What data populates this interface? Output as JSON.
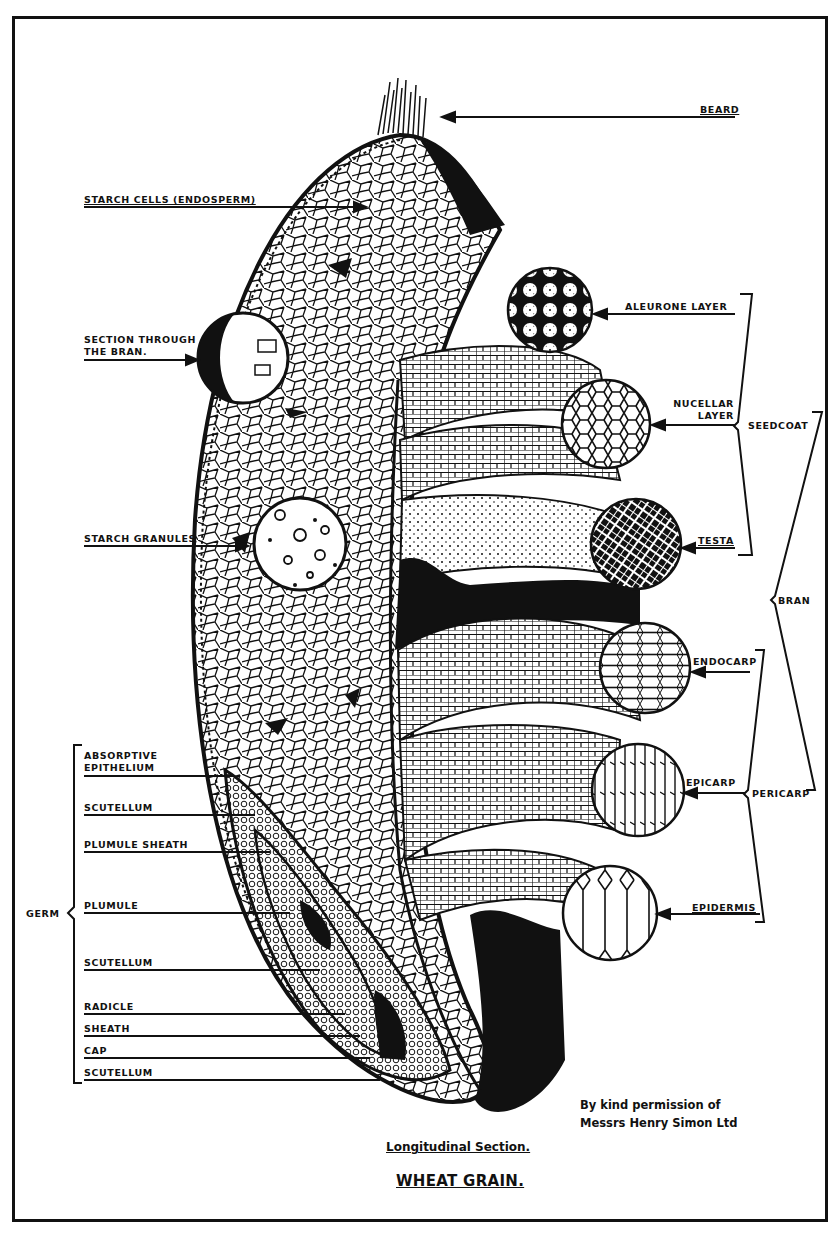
{
  "diagram": {
    "title": "WHEAT GRAIN.",
    "subtitle": "Longitudinal Section.",
    "credit_line1": "By kind permission of",
    "credit_line2": "Messrs Henry Simon Ltd",
    "labels": {
      "beard": "BEARD",
      "starch_cells": "STARCH CELLS  (ENDOSPERM)",
      "section_bran_1": "SECTION THROUGH",
      "section_bran_2": "THE  BRAN.",
      "starch_granules": "STARCH GRANULES",
      "aleurone": "ALEURONE  LAYER",
      "nucellar_1": "NUCELLAR",
      "nucellar_2": "LAYER",
      "seedcoat": "SEEDCOAT",
      "testa": "TESTA",
      "bran": "BRAN",
      "endocarp": "ENDOCARP",
      "epicarp": "EPICARP",
      "pericarp": "PERICARP",
      "epidermis": "EPIDERMIS",
      "germ": "GERM",
      "absorptive_1": "ABSORPTIVE",
      "absorptive_2": "EPITHELIUM",
      "scutellum_1": "SCUTELLUM",
      "plumule_sheath": "PLUMULE SHEATH",
      "plumule": "PLUMULE",
      "scutellum_2": "SCUTELLUM",
      "radicle": "RADICLE",
      "sheath": "SHEATH",
      "cap": "CAP",
      "scutellum_3": "SCUTELLUM"
    },
    "groups": {
      "seedcoat_members": [
        "ALEURONE LAYER",
        "NUCELLAR LAYER",
        "TESTA"
      ],
      "pericarp_members": [
        "ENDOCARP",
        "EPICARP",
        "EPIDERMIS"
      ],
      "bran_members": [
        "SEEDCOAT",
        "PERICARP"
      ],
      "germ_members": [
        "ABSORPTIVE EPITHELIUM",
        "SCUTELLUM",
        "PLUMULE SHEATH",
        "PLUMULE",
        "SCUTELLUM",
        "RADICLE",
        "SHEATH",
        "CAP",
        "SCUTELLUM"
      ]
    }
  }
}
